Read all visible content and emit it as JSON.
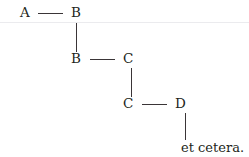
{
  "canvas": {
    "width": 249,
    "height": 157,
    "background": "#ffffff",
    "ink_color": "#231f20",
    "line_color": "#3a3537"
  },
  "rule": {
    "color": "#ebebee",
    "y": 22
  },
  "diagram": {
    "type": "staircase-chain",
    "rows": [
      {
        "left_label": "A",
        "right_label": "B",
        "left_x": 20,
        "right_x": 71,
        "baseline_y": 6,
        "link_x": 38,
        "link_width": 25,
        "link_y": 13
      },
      {
        "left_label": "B",
        "right_label": "C",
        "left_x": 71,
        "right_x": 123,
        "baseline_y": 52,
        "link_x": 90,
        "link_width": 25,
        "link_y": 59
      },
      {
        "left_label": "C",
        "right_label": "D",
        "left_x": 123,
        "right_x": 175,
        "baseline_y": 97,
        "link_x": 142,
        "link_width": 25,
        "link_y": 104
      }
    ],
    "drops": [
      {
        "x": 76,
        "y": 23,
        "height": 29
      },
      {
        "x": 131,
        "y": 68,
        "height": 29
      },
      {
        "x": 185,
        "y": 113,
        "height": 27
      }
    ]
  },
  "tail": {
    "label": "et cetera.",
    "x": 181,
    "y": 141
  }
}
